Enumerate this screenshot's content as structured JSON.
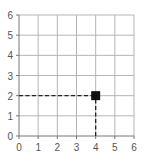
{
  "chart_data": {
    "type": "scatter",
    "title": "",
    "xlabel": "",
    "ylabel": "",
    "xlim": [
      0,
      6
    ],
    "ylim": [
      0,
      6
    ],
    "grid": true,
    "x_ticks": [
      "0",
      "1",
      "2",
      "3",
      "4",
      "5",
      "6"
    ],
    "y_ticks": [
      "0",
      "1",
      "2",
      "3",
      "4",
      "5",
      "6"
    ],
    "points": [
      {
        "x": 4,
        "y": 2,
        "marker": "square"
      }
    ],
    "guides": [
      {
        "from": [
          0,
          2
        ],
        "to": [
          4,
          2
        ],
        "style": "dashed"
      },
      {
        "from": [
          4,
          0
        ],
        "to": [
          4,
          2
        ],
        "style": "dashed"
      }
    ]
  }
}
